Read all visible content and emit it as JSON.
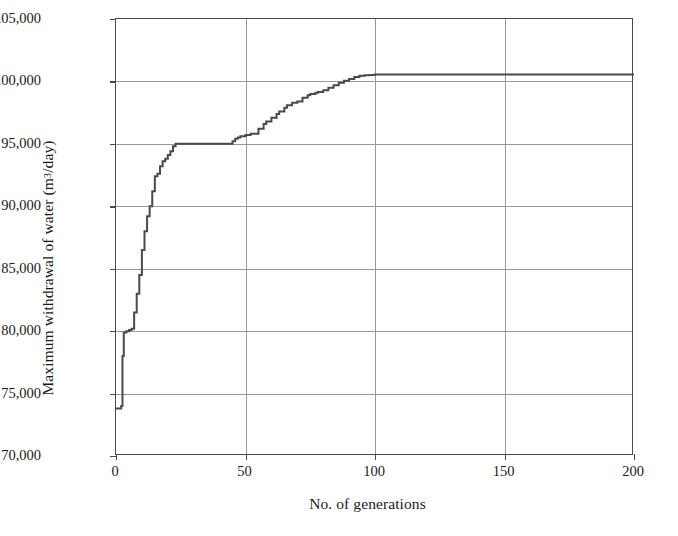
{
  "chart_data": {
    "type": "line",
    "title": "",
    "xlabel": "No. of generations",
    "ylabel_plain": "Maximum withdrawal of water (m3/day)",
    "ylabel_prefix": "Maximum withdrawal of water (m",
    "ylabel_exponent": "3",
    "ylabel_suffix": "/day)",
    "xlim": [
      0,
      200
    ],
    "ylim": [
      70000,
      105000
    ],
    "grid": true,
    "legend": "none",
    "line_color": "#4a4a4a",
    "xticks": [
      0,
      50,
      100,
      150,
      200
    ],
    "xtick_labels": [
      "0",
      "50",
      "100",
      "150",
      "200"
    ],
    "yticks": [
      70000,
      75000,
      80000,
      85000,
      90000,
      95000,
      100000,
      105000
    ],
    "ytick_labels": [
      "70,000",
      "75,000",
      "80,000",
      "85,000",
      "90,000",
      "95,000",
      "1,00,000",
      "1,05,000"
    ],
    "series": [
      {
        "name": "Maximum withdrawal of water",
        "x": [
          0,
          1,
          2,
          2.5,
          3,
          4,
          5,
          6,
          7,
          8,
          9,
          10,
          11,
          12,
          13,
          14,
          15,
          16,
          17,
          18,
          19,
          20,
          21,
          22,
          23,
          24,
          25,
          30,
          35,
          40,
          44,
          45,
          46,
          47,
          48,
          50,
          52,
          55,
          57,
          58,
          60,
          62,
          63,
          65,
          66,
          68,
          70,
          72,
          74,
          75,
          77,
          78,
          80,
          82,
          84,
          86,
          88,
          90,
          92,
          94,
          96,
          98,
          100,
          110,
          120,
          130,
          140,
          150,
          160,
          170,
          180,
          190,
          200
        ],
        "y": [
          73800,
          73800,
          74000,
          78000,
          79900,
          80000,
          80100,
          80200,
          81500,
          83000,
          84500,
          86500,
          88000,
          89200,
          90000,
          91200,
          92400,
          92600,
          93200,
          93600,
          93800,
          94100,
          94400,
          94800,
          95000,
          95000,
          95000,
          95000,
          95000,
          95000,
          95000,
          95200,
          95400,
          95500,
          95600,
          95700,
          95800,
          96200,
          96600,
          96800,
          97100,
          97400,
          97600,
          97900,
          98100,
          98300,
          98400,
          98700,
          98900,
          99000,
          99100,
          99150,
          99300,
          99500,
          99700,
          99900,
          100050,
          100200,
          100350,
          100450,
          100500,
          100520,
          100550,
          100550,
          100550,
          100550,
          100550,
          100550,
          100550,
          100550,
          100550,
          100550,
          100550
        ]
      }
    ]
  }
}
